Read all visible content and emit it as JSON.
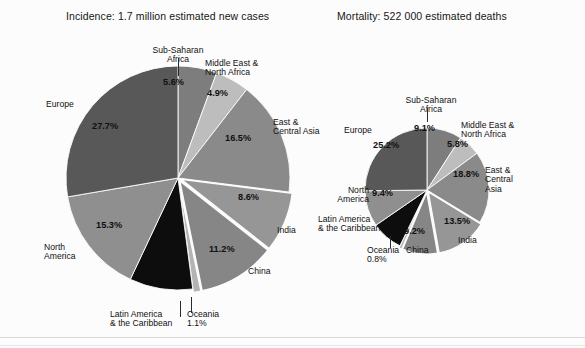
{
  "figure": {
    "background": "#fcfcfc",
    "panels": [
      {
        "key": "incidence",
        "title": "Incidence: 1.7 million estimated new cases"
      },
      {
        "key": "mortality",
        "title": "Mortality: 522 000 estimated deaths"
      }
    ]
  },
  "labels": {
    "sub_saharan_africa": "Sub-Saharan\nAfrica",
    "middle_east_north_africa": "Middle East &\nNorth Africa",
    "east_central_asia_big": "East &\nCentral Asia",
    "east_central_asia_small": "East &\nCentral\nAsia",
    "india": "India",
    "china": "China",
    "oceania": "Oceania",
    "latin_america": "Latin America\n& the Caribbean",
    "north_america": "North\nAmerica",
    "europe": "Europe"
  },
  "values": {
    "incidence": {
      "sub_saharan_africa": "5.6%",
      "middle_east_north_africa": "4.9%",
      "east_central_asia": "16.5%",
      "india": "8.6%",
      "china": "11.2%",
      "oceania": "1.1%",
      "latin_america": "",
      "north_america": "15.3%",
      "europe": "27.7%"
    },
    "mortality": {
      "sub_saharan_africa": "9.1%",
      "middle_east_north_africa": "5.8%",
      "east_central_asia": "18.8%",
      "india": "13.5%",
      "china": "9.2%",
      "oceania": "0.8%",
      "latin_america": "",
      "north_america": "9.4%",
      "europe": "25.2%"
    }
  },
  "chart_data": [
    {
      "type": "pie",
      "title": "Incidence: 1.7 million estimated new cases",
      "unit": "percent of 1.7 million estimated new cases",
      "total_label": "1.7 million estimated new cases",
      "legend": "none (direct labels)",
      "start_angle_deg": 0,
      "direction": "clockwise",
      "categories": [
        "Sub-Saharan Africa",
        "Middle East & North Africa",
        "East & Central Asia",
        "India",
        "China",
        "Oceania",
        "Latin America & the Caribbean",
        "North America",
        "Europe"
      ],
      "values": [
        5.6,
        4.9,
        16.5,
        8.6,
        11.2,
        1.1,
        9.1,
        15.3,
        27.7
      ],
      "labels": [
        "5.6%",
        "4.9%",
        "16.5%",
        "8.6%",
        "11.2%",
        "1.1%",
        "",
        "15.3%",
        "27.7%"
      ],
      "colors": [
        "#7d7d7d",
        "#bdbdbd",
        "#8a8a8a",
        "#969696",
        "#868686",
        "#b4b4b4",
        "#0d0d0d",
        "#8f8f8f",
        "#585858"
      ],
      "exploded": [
        "India",
        "China",
        "Oceania"
      ]
    },
    {
      "type": "pie",
      "title": "Mortality: 522 000 estimated deaths",
      "unit": "percent of 522 000 estimated deaths",
      "total_label": "522 000 estimated deaths",
      "legend": "none (direct labels)",
      "start_angle_deg": 0,
      "direction": "clockwise",
      "categories": [
        "Sub-Saharan Africa",
        "Middle East & North Africa",
        "East & Central Asia",
        "India",
        "China",
        "Oceania",
        "Latin America & the Caribbean",
        "North America",
        "Europe"
      ],
      "values": [
        9.1,
        5.8,
        18.8,
        13.5,
        9.2,
        0.8,
        8.2,
        9.4,
        25.2
      ],
      "labels": [
        "9.1%",
        "5.8%",
        "18.8%",
        "13.5%",
        "9.2%",
        "0.8%",
        "",
        "9.4%",
        "25.2%"
      ],
      "colors": [
        "#7d7d7d",
        "#bdbdbd",
        "#8a8a8a",
        "#969696",
        "#868686",
        "#b4b4b4",
        "#0d0d0d",
        "#8f8f8f",
        "#585858"
      ],
      "exploded": [
        "India",
        "China",
        "Oceania"
      ]
    }
  ]
}
